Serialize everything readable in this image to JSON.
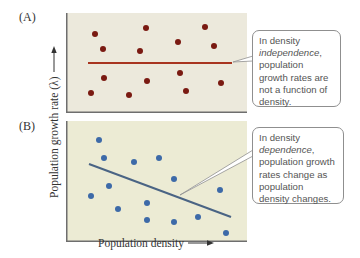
{
  "chart_data": [
    {
      "type": "scatter",
      "panel": "A",
      "title": "Density independence",
      "xlabel": "Population density",
      "ylabel": "Population growth rate (λ)",
      "trend": "horizontal line (no relationship)",
      "points": [
        {
          "x": 29,
          "y": 79
        },
        {
          "x": 37,
          "y": 64
        },
        {
          "x": 80,
          "y": 85
        },
        {
          "x": 74,
          "y": 62
        },
        {
          "x": 38,
          "y": 35
        },
        {
          "x": 25,
          "y": 20
        },
        {
          "x": 63,
          "y": 18
        },
        {
          "x": 81,
          "y": 32
        },
        {
          "x": 112,
          "y": 71
        },
        {
          "x": 139,
          "y": 86
        },
        {
          "x": 148,
          "y": 67
        },
        {
          "x": 114,
          "y": 40
        },
        {
          "x": 120,
          "y": 22
        },
        {
          "x": 155,
          "y": 30
        }
      ],
      "line": {
        "x1": 22,
        "y1": 50,
        "x2": 166,
        "y2": 50
      },
      "point_color": "#7a1a12",
      "line_color": "#a8341f",
      "background": "#ece9dc",
      "annotation": "In density independence, population growth rates are not a function of density."
    },
    {
      "type": "scatter",
      "panel": "B",
      "title": "Density dependence",
      "xlabel": "Population density",
      "ylabel": "Population growth rate (λ)",
      "trend": "negative linear (growth rate declines as density increases)",
      "points": [
        {
          "x": 33,
          "y": 102
        },
        {
          "x": 38,
          "y": 84
        },
        {
          "x": 68,
          "y": 80
        },
        {
          "x": 43,
          "y": 56
        },
        {
          "x": 25,
          "y": 46
        },
        {
          "x": 52,
          "y": 33
        },
        {
          "x": 81,
          "y": 39
        },
        {
          "x": 81,
          "y": 22
        },
        {
          "x": 93,
          "y": 84
        },
        {
          "x": 108,
          "y": 63
        },
        {
          "x": 154,
          "y": 52
        },
        {
          "x": 108,
          "y": 20
        },
        {
          "x": 132,
          "y": 25
        },
        {
          "x": 160,
          "y": 9
        }
      ],
      "line": {
        "x1": 23,
        "y1": 78,
        "x2": 165,
        "y2": 25
      },
      "point_color": "#3d6aa8",
      "line_color": "#4a6484",
      "background": "#ecebd4",
      "annotation": "In density dependence, population growth rates change as population density changes."
    }
  ],
  "labels": {
    "panel_a": "(A)",
    "panel_b": "(B)",
    "y_axis": "Population growth rate (λ)",
    "x_axis": "Population density"
  },
  "callouts": {
    "a": {
      "line1": "In density",
      "italic": "independence",
      "after_italic": ",",
      "rest": [
        "population",
        "growth rates are",
        "not a function of",
        "density."
      ]
    },
    "b": {
      "line1": "In density",
      "italic": "dependence",
      "after_italic": ",",
      "rest": [
        "population growth",
        "rates change as",
        "population",
        "density changes."
      ]
    }
  }
}
